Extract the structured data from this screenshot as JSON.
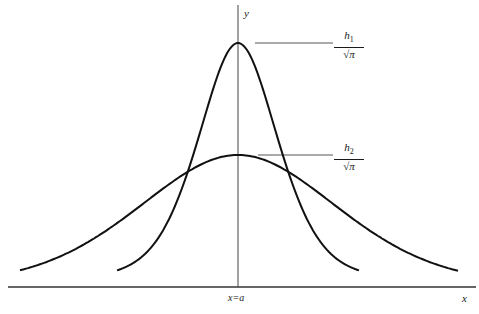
{
  "diagram": {
    "type": "two Gaussian-like distribution curves sharing a common center",
    "axes": {
      "x_label": "x",
      "y_label": "y",
      "center_label": "x=a"
    },
    "curves": [
      {
        "name": "narrow-tall",
        "peak_label": {
          "numerator": "h",
          "subscript": "1",
          "denominator": "π"
        },
        "peak_px": [
          238,
          43
        ],
        "x_range_px": [
          117,
          360
        ],
        "halfwidth_px": 48,
        "shape_mix": 0.55
      },
      {
        "name": "wide-short",
        "peak_label": {
          "numerator": "h",
          "subscript": "2",
          "denominator": "π"
        },
        "peak_px": [
          238,
          155
        ],
        "x_range_px": [
          20,
          458
        ],
        "halfwidth_px": 118,
        "shape_mix": 0.75
      }
    ],
    "baseline_px": 287,
    "colors": {
      "curve": "#111111",
      "axis": "#333333",
      "leader": "#555555",
      "background": "#ffffff"
    }
  }
}
